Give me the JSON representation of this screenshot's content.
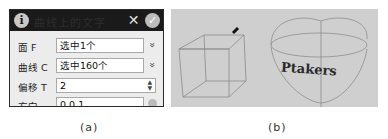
{
  "figure_a": {
    "dialog": {
      "title": "曲线上的文字",
      "icons": {
        "info": "i",
        "close": "✕",
        "confirm": "✓"
      },
      "rows": [
        {
          "label": "面 F",
          "value": "选中1个",
          "control": "selector"
        },
        {
          "label": "曲线 C",
          "value": "选中160个",
          "control": "selector"
        },
        {
          "label": "偏移 T",
          "value": "2",
          "control": "spinner"
        },
        {
          "label": "方向",
          "value": "0,0,1",
          "control": "direction-picker"
        }
      ],
      "chevron": "»",
      "spinner_arrows": "▲▼"
    },
    "caption": "(a)"
  },
  "figure_b": {
    "viewport_text": "Ptakers",
    "objects": [
      "wireframe-cube",
      "bowl-surface"
    ],
    "background": "#cfcfcf",
    "caption": "(b)"
  }
}
